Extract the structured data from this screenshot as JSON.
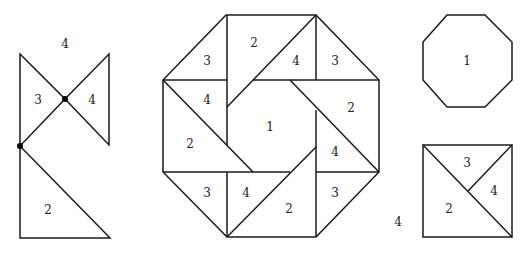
{
  "figures": {
    "left": {
      "labels": {
        "top": "4",
        "left_triangle": "3",
        "right_triangle": "4",
        "bottom_triangle": "2"
      }
    },
    "center": {
      "labels": {
        "center_octagon": "1",
        "tl_corner": "3",
        "top_trap": "2",
        "top_tri": "4",
        "tr_corner": "3",
        "left_tri": "4",
        "left_trap": "2",
        "right_trap": "2",
        "right_tri": "4",
        "bl_corner": "3",
        "bottom_tri": "4",
        "bottom_trap": "2",
        "br_corner": "3"
      }
    },
    "right_octagon": {
      "label": "1"
    },
    "right_square": {
      "labels": {
        "top": "3",
        "right": "4",
        "left": "2",
        "outside": "4"
      }
    }
  },
  "colors": {
    "stroke": "#1a1a1a",
    "background": "#ffffff"
  }
}
